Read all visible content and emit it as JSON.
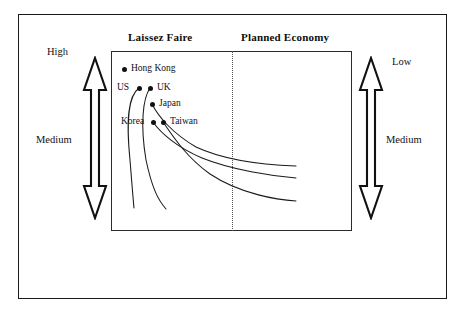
{
  "figure": {
    "headers": {
      "left": "Laissez Faire",
      "right": "Planned Economy"
    },
    "left_axis": {
      "top_label": "High",
      "middle_label": "Medium",
      "arrow": "double-headed-vertical-arrow"
    },
    "right_axis": {
      "top_label": "Low",
      "middle_label": "Medium",
      "arrow": "double-headed-vertical-arrow"
    },
    "points": [
      {
        "label": "Hong Kong",
        "x": 124,
        "y": 69,
        "label_x": 131,
        "label_y": 63
      },
      {
        "label": "US",
        "x": 139,
        "y": 88,
        "label_x": 117,
        "label_y": 82
      },
      {
        "label": "UK",
        "x": 150,
        "y": 88,
        "label_x": 157,
        "label_y": 82
      },
      {
        "label": "Japan",
        "x": 152,
        "y": 104,
        "label_x": 159,
        "label_y": 98
      },
      {
        "label": "Korea",
        "x": 153,
        "y": 122,
        "label_x": 121,
        "label_y": 116
      },
      {
        "label": "Taiwan",
        "x": 163,
        "y": 122,
        "label_x": 170,
        "label_y": 116
      }
    ],
    "divider": "dotted-vertical-line"
  },
  "chart_data": {
    "type": "line",
    "title": "",
    "xlabel": "",
    "ylabel": "",
    "x_axis_categories": [
      "Laissez Faire",
      "Planned Economy"
    ],
    "y_axis_left_scale": [
      "High",
      "Medium"
    ],
    "y_axis_right_scale": [
      "Low",
      "Medium"
    ],
    "grid": false,
    "legend": "none",
    "annotations": [
      "Hong Kong",
      "US",
      "UK",
      "Japan",
      "Korea",
      "Taiwan"
    ],
    "series": [
      {
        "name": "US",
        "path": "M139,88 C128,96 126,120 130,160 C132,185 133,198 134,208"
      },
      {
        "name": "UK",
        "path": "M150,88 C143,98 140,124 146,160 C152,188 158,200 166,209"
      },
      {
        "name": "Japan",
        "path": "M152,104 C158,116 172,133 196,147 C226,161 268,165 296,166"
      },
      {
        "name": "Korea",
        "path": "M153,122 C160,132 176,147 202,158 C232,170 272,176 296,178"
      },
      {
        "name": "Taiwan",
        "path": "M163,122 C172,135 186,157 210,174 C240,194 278,200 296,201"
      }
    ]
  }
}
